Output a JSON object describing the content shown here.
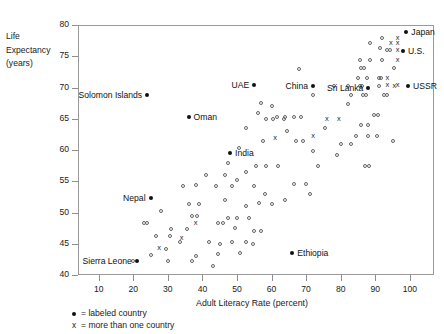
{
  "chart_data": {
    "type": "scatter",
    "title": "",
    "xlabel": "Adult Literacy Rate (percent)",
    "ylabel_lines": [
      "Life",
      "Expectancy",
      "(years)"
    ],
    "xlim": [
      4,
      107
    ],
    "ylim": [
      40,
      80
    ],
    "xticks": [
      10,
      20,
      30,
      40,
      50,
      60,
      70,
      80,
      90,
      100
    ],
    "yticks": [
      40,
      45,
      50,
      55,
      60,
      65,
      70,
      75,
      80
    ],
    "grid": false,
    "legend_position": "below-axis-left",
    "legend": [
      {
        "marker": "filled-dot",
        "text": "= labeled country"
      },
      {
        "marker": "x",
        "text": "= more than one country"
      }
    ],
    "labeled_points": [
      {
        "name": "Japan",
        "x": 99,
        "y": 78.9,
        "label_side": "right"
      },
      {
        "name": "U.S.",
        "x": 98,
        "y": 75.8,
        "label_side": "right"
      },
      {
        "name": "USSR",
        "x": 99.5,
        "y": 70.2,
        "label_side": "right"
      },
      {
        "name": "Sri Lanka",
        "x": 88,
        "y": 70.0,
        "label_side": "left"
      },
      {
        "name": "China",
        "x": 72,
        "y": 70.3,
        "label_side": "left"
      },
      {
        "name": "UAE",
        "x": 55,
        "y": 70.4,
        "label_side": "left"
      },
      {
        "name": "Solomon Islands",
        "x": 24,
        "y": 68.8,
        "label_side": "left"
      },
      {
        "name": "Oman",
        "x": 36,
        "y": 65.3,
        "label_side": "right"
      },
      {
        "name": "India",
        "x": 48,
        "y": 59.6,
        "label_side": "right"
      },
      {
        "name": "Nepal",
        "x": 25,
        "y": 52.3,
        "label_side": "left"
      },
      {
        "name": "Ethiopia",
        "x": 66,
        "y": 43.6,
        "label_side": "right"
      },
      {
        "name": "Sierra Leone",
        "x": 21,
        "y": 42.3,
        "label_side": "left"
      }
    ],
    "multi_points": [
      {
        "x": 96.5,
        "y": 78.0
      },
      {
        "x": 94.5,
        "y": 77.2
      },
      {
        "x": 96.5,
        "y": 77.2
      },
      {
        "x": 96.5,
        "y": 76.0
      },
      {
        "x": 96.5,
        "y": 74.4
      },
      {
        "x": 93.5,
        "y": 71.6
      },
      {
        "x": 95.5,
        "y": 70.2
      },
      {
        "x": 93.5,
        "y": 70.4
      },
      {
        "x": 96.5,
        "y": 70.4
      },
      {
        "x": 79.5,
        "y": 64.9
      },
      {
        "x": 76.0,
        "y": 64.9
      },
      {
        "x": 72.0,
        "y": 62.3
      },
      {
        "x": 61.0,
        "y": 62.0
      },
      {
        "x": 38.0,
        "y": 48.3
      },
      {
        "x": 34.0,
        "y": 46.0
      },
      {
        "x": 27.5,
        "y": 44.3
      }
    ],
    "single_points": [
      {
        "x": 92.0,
        "y": 78.0
      },
      {
        "x": 88.5,
        "y": 77.2
      },
      {
        "x": 91.5,
        "y": 76.4
      },
      {
        "x": 93.5,
        "y": 76.0
      },
      {
        "x": 94.3,
        "y": 76.0
      },
      {
        "x": 85.5,
        "y": 74.4
      },
      {
        "x": 88.5,
        "y": 74.4
      },
      {
        "x": 92.0,
        "y": 74.4
      },
      {
        "x": 86.0,
        "y": 73.1
      },
      {
        "x": 86.8,
        "y": 73.1
      },
      {
        "x": 95.5,
        "y": 73.1
      },
      {
        "x": 68.0,
        "y": 73.0
      },
      {
        "x": 85.0,
        "y": 71.6
      },
      {
        "x": 87.5,
        "y": 71.6
      },
      {
        "x": 91.0,
        "y": 71.6
      },
      {
        "x": 91.8,
        "y": 71.6
      },
      {
        "x": 78.0,
        "y": 70.3
      },
      {
        "x": 82.0,
        "y": 70.3
      },
      {
        "x": 85.5,
        "y": 70.2
      },
      {
        "x": 86.3,
        "y": 70.2
      },
      {
        "x": 91.0,
        "y": 70.2
      },
      {
        "x": 72.0,
        "y": 68.8
      },
      {
        "x": 83.0,
        "y": 68.8
      },
      {
        "x": 86.5,
        "y": 68.8
      },
      {
        "x": 87.3,
        "y": 68.8
      },
      {
        "x": 92.5,
        "y": 68.8
      },
      {
        "x": 93.3,
        "y": 68.8
      },
      {
        "x": 57.0,
        "y": 67.6
      },
      {
        "x": 60.0,
        "y": 67.0
      },
      {
        "x": 82.0,
        "y": 67.4
      },
      {
        "x": 56.0,
        "y": 65.9
      },
      {
        "x": 61.5,
        "y": 65.3
      },
      {
        "x": 64.0,
        "y": 65.3
      },
      {
        "x": 66.5,
        "y": 65.3
      },
      {
        "x": 68.5,
        "y": 65.3
      },
      {
        "x": 89.5,
        "y": 65.6
      },
      {
        "x": 90.8,
        "y": 65.6
      },
      {
        "x": 58.5,
        "y": 64.9
      },
      {
        "x": 60.5,
        "y": 64.9
      },
      {
        "x": 63.5,
        "y": 64.9
      },
      {
        "x": 86.0,
        "y": 64.0
      },
      {
        "x": 88.0,
        "y": 64.0
      },
      {
        "x": 52.5,
        "y": 63.5
      },
      {
        "x": 64.5,
        "y": 63.0
      },
      {
        "x": 75.5,
        "y": 63.6
      },
      {
        "x": 84.5,
        "y": 62.3
      },
      {
        "x": 88.0,
        "y": 62.3
      },
      {
        "x": 90.5,
        "y": 62.3
      },
      {
        "x": 57.5,
        "y": 61.5
      },
      {
        "x": 67.0,
        "y": 61.4
      },
      {
        "x": 69.0,
        "y": 61.4
      },
      {
        "x": 80.0,
        "y": 61.0
      },
      {
        "x": 83.0,
        "y": 61.0
      },
      {
        "x": 95.0,
        "y": 61.4
      },
      {
        "x": 50.5,
        "y": 60.3
      },
      {
        "x": 72.0,
        "y": 59.8
      },
      {
        "x": 79.0,
        "y": 59.2
      },
      {
        "x": 47.5,
        "y": 58.0
      },
      {
        "x": 55.5,
        "y": 57.5
      },
      {
        "x": 58.5,
        "y": 57.5
      },
      {
        "x": 62.0,
        "y": 57.5
      },
      {
        "x": 73.5,
        "y": 57.5
      },
      {
        "x": 87.0,
        "y": 57.5
      },
      {
        "x": 88.2,
        "y": 57.5
      },
      {
        "x": 46.5,
        "y": 56.0
      },
      {
        "x": 52.5,
        "y": 56.5
      },
      {
        "x": 50.0,
        "y": 55.2
      },
      {
        "x": 44.0,
        "y": 54.3
      },
      {
        "x": 48.5,
        "y": 54.3
      },
      {
        "x": 55.0,
        "y": 54.3
      },
      {
        "x": 66.5,
        "y": 54.5
      },
      {
        "x": 70.0,
        "y": 54.5
      },
      {
        "x": 34.5,
        "y": 54.3
      },
      {
        "x": 38.0,
        "y": 54.4
      },
      {
        "x": 71.0,
        "y": 53.0
      },
      {
        "x": 36.0,
        "y": 51.3
      },
      {
        "x": 39.0,
        "y": 51.3
      },
      {
        "x": 52.5,
        "y": 51.0
      },
      {
        "x": 56.5,
        "y": 51.5
      },
      {
        "x": 60.0,
        "y": 51.3
      },
      {
        "x": 28.0,
        "y": 50.2
      },
      {
        "x": 37.0,
        "y": 49.5
      },
      {
        "x": 38.5,
        "y": 49.4
      },
      {
        "x": 47.5,
        "y": 49.2
      },
      {
        "x": 50.0,
        "y": 49.2
      },
      {
        "x": 53.5,
        "y": 49.2
      },
      {
        "x": 44.5,
        "y": 48.3
      },
      {
        "x": 46.0,
        "y": 48.3
      },
      {
        "x": 23.0,
        "y": 48.3
      },
      {
        "x": 24.0,
        "y": 48.3
      },
      {
        "x": 31.0,
        "y": 47.3
      },
      {
        "x": 35.5,
        "y": 47.3
      },
      {
        "x": 49.5,
        "y": 47.6
      },
      {
        "x": 55.0,
        "y": 47.0
      },
      {
        "x": 57.0,
        "y": 47.0
      },
      {
        "x": 26.5,
        "y": 46.2
      },
      {
        "x": 30.5,
        "y": 46.2
      },
      {
        "x": 33.5,
        "y": 45.3
      },
      {
        "x": 42.0,
        "y": 45.3
      },
      {
        "x": 45.0,
        "y": 45.0
      },
      {
        "x": 48.5,
        "y": 45.3
      },
      {
        "x": 52.5,
        "y": 45.3
      },
      {
        "x": 54.5,
        "y": 45.0
      },
      {
        "x": 29.5,
        "y": 44.2
      },
      {
        "x": 51.0,
        "y": 43.6
      },
      {
        "x": 44.5,
        "y": 43.3
      },
      {
        "x": 25.0,
        "y": 43.2
      },
      {
        "x": 38.0,
        "y": 43.0
      },
      {
        "x": 30.0,
        "y": 42.3
      },
      {
        "x": 37.0,
        "y": 42.3
      },
      {
        "x": 20.0,
        "y": 42.3
      },
      {
        "x": 43.0,
        "y": 41.5
      },
      {
        "x": 58.0,
        "y": 53.0
      },
      {
        "x": 64.0,
        "y": 52.0
      },
      {
        "x": 46.5,
        "y": 52.0
      },
      {
        "x": 41.0,
        "y": 56.0
      }
    ]
  }
}
